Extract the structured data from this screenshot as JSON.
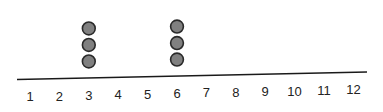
{
  "chart_data": {
    "type": "scatter",
    "subtype": "dot_plot",
    "title": "",
    "xlabel": "",
    "ylabel": "",
    "categories": [
      "1",
      "2",
      "3",
      "4",
      "5",
      "6",
      "7",
      "8",
      "9",
      "10",
      "11",
      "12"
    ],
    "values": [
      0,
      0,
      3,
      0,
      0,
      3,
      0,
      0,
      0,
      0,
      0,
      0
    ],
    "points": [
      {
        "x": 3,
        "count": 3
      },
      {
        "x": 6,
        "count": 3
      }
    ],
    "xlim": [
      1,
      12
    ],
    "grid": false,
    "legend": null,
    "dot_color": "#808080",
    "dot_stroke": "#2a2a2a"
  },
  "axis": {
    "tick_labels": [
      "1",
      "2",
      "3",
      "4",
      "5",
      "6",
      "7",
      "8",
      "9",
      "10",
      "11",
      "12"
    ]
  }
}
